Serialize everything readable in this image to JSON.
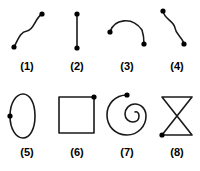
{
  "figure": {
    "title": "",
    "background_color": "#ffffff",
    "stroke_color": "#1a1a1a",
    "dot_color": "#000000",
    "stroke_width": 1.6,
    "dot_radius": 2.6,
    "columns": 4,
    "rows": 2,
    "items": [
      {
        "id": "shape-1",
        "label": "(1)",
        "shape": "s-curve-horizontal",
        "description": "Open S-shaped curve rising from lower-left endpoint to upper-right endpoint",
        "closed": false,
        "endpoints": [
          [
            12,
            45
          ],
          [
            40,
            12
          ]
        ],
        "path": "M 12 45 C 16 38 18 30 25 29 C 32 28 33 16 40 12",
        "dots": [
          [
            12,
            45
          ],
          [
            40,
            12
          ]
        ]
      },
      {
        "id": "shape-2",
        "label": "(2)",
        "shape": "straight-segment-vertical",
        "description": "Straight vertical line segment with dots at both endpoints",
        "closed": false,
        "endpoints": [
          [
            25,
            12
          ],
          [
            25,
            46
          ]
        ],
        "path": "M 25 12 L 25 46",
        "dots": [
          [
            25,
            12
          ],
          [
            25,
            46
          ]
        ]
      },
      {
        "id": "shape-3",
        "label": "(3)",
        "shape": "arc-concave-down",
        "description": "Single arc bowing upward, left endpoint higher than right endpoint",
        "closed": false,
        "endpoints": [
          [
            8,
            30
          ],
          [
            42,
            42
          ]
        ],
        "path": "M 8 30 C 12 17 30 14 40 28 C 41 31 42 38 42 42",
        "dots": [
          [
            8,
            30
          ],
          [
            42,
            42
          ]
        ]
      },
      {
        "id": "shape-4",
        "label": "(4)",
        "shape": "s-curve-vertical",
        "description": "Open S-shaped curve descending from upper-left endpoint to lower-right endpoint",
        "closed": false,
        "endpoints": [
          [
            11,
            9
          ],
          [
            32,
            42
          ]
        ],
        "path": "M 11 9 C 12 17 22 19 23 26 C 24 33 30 34 32 42",
        "dots": [
          [
            11,
            9
          ],
          [
            32,
            42
          ]
        ]
      },
      {
        "id": "shape-5",
        "label": "(5)",
        "shape": "ellipse-closed",
        "description": "Closed vertical ellipse with a single dot on its left side",
        "closed": true,
        "endpoints": [
          [
            8,
            28
          ]
        ],
        "path": "M 8 28 C 8 15 14 6 21 6 C 28 6 33 15 33 28 C 33 41 28 50 21 50 C 14 50 8 41 8 28 Z",
        "dots": [
          [
            8,
            28
          ]
        ]
      },
      {
        "id": "shape-6",
        "label": "(6)",
        "shape": "square-closed",
        "description": "Closed square outline with a single dot at the top-right corner",
        "closed": true,
        "endpoints": [
          [
            42,
            9
          ]
        ],
        "path": "M 42 9 L 7 9 L 7 45 L 42 45 Z",
        "dots": [
          [
            42,
            9
          ]
        ]
      },
      {
        "id": "shape-7",
        "label": "(7)",
        "shape": "spiral",
        "description": "Spiral curve starting at a dot on the top, winding inward to a small inner loop",
        "closed": false,
        "endpoints": [
          [
            25,
            7
          ]
        ],
        "path": "M 25 7 C 13 7 5 16 5 27 C 5 38 13 47 25 47 C 36 47 44 38 44 28 C 44 21 39 16 33 16 C 27 16 23 21 23 26 C 23 31 27 34 31 34 C 35 34 37 31 37 28 C 37 25 35 23 33 24",
        "dots": [
          [
            25,
            7
          ]
        ]
      },
      {
        "id": "shape-8",
        "label": "(8)",
        "shape": "figure-eight-bowtie",
        "description": "Closed bowtie / hourglass figure-eight with a dot at the bottom-left corner",
        "closed": true,
        "endpoints": [
          [
            10,
            47
          ]
        ],
        "path": "M 10 47 L 40 9 L 10 9 L 40 47 Z",
        "dots": [
          [
            10,
            47
          ]
        ]
      }
    ]
  }
}
